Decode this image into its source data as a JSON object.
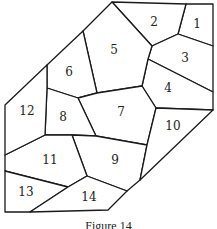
{
  "figure": {
    "caption": "Figure 14",
    "stroke_color": "#1a1a1a",
    "label_color": "#222222",
    "regions": [
      {
        "id": "1",
        "label": "1",
        "label_pos": [
          197,
          24
        ],
        "points": "186,4 213,4 213,46 178,34"
      },
      {
        "id": "2",
        "label": "2",
        "label_pos": [
          154,
          22
        ],
        "points": "112,2 186,4 178,34 152,46"
      },
      {
        "id": "3",
        "label": "3",
        "label_pos": [
          185,
          58
        ],
        "points": "178,34 213,46 213,92 148,59 152,46"
      },
      {
        "id": "4",
        "label": "4",
        "label_pos": [
          168,
          88
        ],
        "points": "148,59 213,92 213,110 156,108 142,86"
      },
      {
        "id": "5",
        "label": "5",
        "label_pos": [
          114,
          50
        ],
        "points": "112,2 152,46 148,59 142,86 97,93 83,31"
      },
      {
        "id": "6",
        "label": "6",
        "label_pos": [
          69,
          72
        ],
        "points": "83,31 97,93 78,98 47,88 47,65"
      },
      {
        "id": "7",
        "label": "7",
        "label_pos": [
          121,
          112
        ],
        "points": "78,98 97,93 142,86 156,108 147,145 96,136"
      },
      {
        "id": "8",
        "label": "8",
        "label_pos": [
          63,
          117
        ],
        "points": "47,88 78,98 96,136 72,135 45,135"
      },
      {
        "id": "9",
        "label": "9",
        "label_pos": [
          115,
          160
        ],
        "points": "72,135 96,136 147,145 140,180 127,191 87,176"
      },
      {
        "id": "10",
        "label": "10",
        "label_pos": [
          173,
          126
        ],
        "points": "156,108 213,110 140,180 147,145"
      },
      {
        "id": "11",
        "label": "11",
        "label_pos": [
          50,
          160
        ],
        "points": "45,135 72,135 87,176 68,187 5,171 5,155"
      },
      {
        "id": "12",
        "label": "12",
        "label_pos": [
          27,
          111
        ],
        "points": "5,105 47,65 47,88 45,135 5,155"
      },
      {
        "id": "13",
        "label": "13",
        "label_pos": [
          26,
          192
        ],
        "points": "5,171 68,187 30,212 5,212"
      },
      {
        "id": "14",
        "label": "14",
        "label_pos": [
          89,
          197
        ],
        "points": "68,187 87,176 127,191 108,210 30,212"
      }
    ]
  }
}
